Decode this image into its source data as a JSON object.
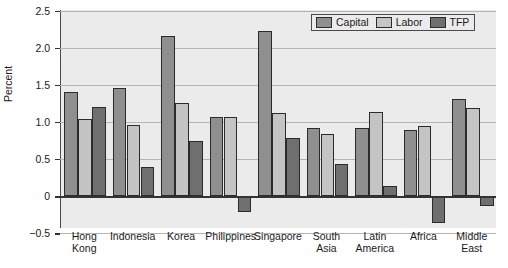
{
  "chart_data": {
    "type": "bar",
    "title": "",
    "xlabel": "",
    "ylabel": "Percent",
    "ylim": [
      -0.5,
      2.5
    ],
    "yticks": [
      "2.5",
      "2.0",
      "1.5",
      "1.0",
      "0.5",
      "0",
      "-0.5"
    ],
    "ytick_values": [
      2.5,
      2.0,
      1.5,
      1.0,
      0.5,
      0,
      -0.5
    ],
    "grid": true,
    "legend_position": "top-right",
    "categories": [
      "Hong Kong",
      "Indonesia",
      "Korea",
      "Philippines",
      "Singapore",
      "South Asia",
      "Latin America",
      "Africa",
      "Middle East"
    ],
    "category_lines": [
      [
        "Hong",
        "Kong"
      ],
      [
        "Indonesia"
      ],
      [
        "Korea"
      ],
      [
        "Philippines"
      ],
      [
        "Singapore"
      ],
      [
        "South",
        "Asia"
      ],
      [
        "Latin",
        "America"
      ],
      [
        "Africa"
      ],
      [
        "Middle",
        "East"
      ]
    ],
    "series": [
      {
        "name": "Capital",
        "color": "#8f8f8f",
        "values": [
          1.4,
          1.46,
          2.16,
          1.06,
          2.22,
          0.92,
          0.92,
          0.89,
          1.31
        ]
      },
      {
        "name": "Labor",
        "color": "#c4c4c4",
        "values": [
          1.04,
          0.96,
          1.26,
          1.06,
          1.12,
          0.84,
          1.13,
          0.95,
          1.18
        ]
      },
      {
        "name": "TFP",
        "color": "#6f6f6f",
        "values": [
          1.2,
          0.39,
          0.74,
          -0.22,
          0.78,
          0.43,
          0.13,
          -0.36,
          -0.14
        ]
      }
    ]
  },
  "legend": {
    "items": [
      {
        "label": "Capital",
        "key": "capital"
      },
      {
        "label": "Labor",
        "key": "labor"
      },
      {
        "label": "TFP",
        "key": "tfp"
      }
    ]
  }
}
